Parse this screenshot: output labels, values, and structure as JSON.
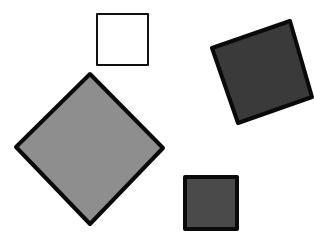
{
  "diagram": {
    "title": "Squares of different shades and orientations",
    "background": "#ffffff",
    "shapes": [
      {
        "id": "white-square",
        "label": "White square",
        "fill": "#ffffff",
        "stroke": "#111111",
        "stroke_width": 2,
        "points": "97,14 148,14 148,65 97,65"
      },
      {
        "id": "dark-tilted-square",
        "label": "Dark gray tilted square",
        "fill": "#3a3a3a",
        "stroke": "#0a0a0a",
        "stroke_width": 4,
        "points": "212,48 290,21 312,97 238,123"
      },
      {
        "id": "gray-diamond",
        "label": "Medium gray diamond",
        "fill": "#8e8e8e",
        "stroke": "#0a0a0a",
        "stroke_width": 4,
        "points": "90,74 163,148 90,224 16,147"
      },
      {
        "id": "small-dark-square",
        "label": "Small dark gray square",
        "fill": "#4a4a4a",
        "stroke": "#0a0a0a",
        "stroke_width": 4,
        "points": "185,177 237,177 237,229 185,229"
      }
    ]
  }
}
